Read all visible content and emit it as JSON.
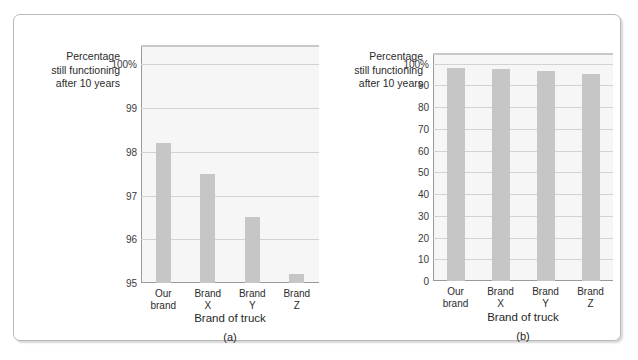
{
  "figure": {
    "panels": [
      {
        "id": "a",
        "caption": "(a)",
        "y_caption_lines": [
          "Percentage",
          "still functioning",
          "after 10 years"
        ],
        "x_axis_title": "Brand of truck",
        "chart_data": {
          "type": "bar",
          "title": "",
          "xlabel": "Brand of truck",
          "ylabel": "Percentage still functioning after 10 years",
          "categories": [
            "Our brand",
            "Brand X",
            "Brand Y",
            "Brand Z"
          ],
          "category_lines": [
            [
              "Our",
              "brand"
            ],
            [
              "Brand",
              "X"
            ],
            [
              "Brand",
              "Y"
            ],
            [
              "Brand",
              "Z"
            ]
          ],
          "values": [
            98.2,
            97.5,
            96.5,
            95.2
          ],
          "ylim": [
            95,
            100.4
          ],
          "yticks": [
            95,
            96,
            97,
            98,
            99,
            100
          ],
          "ytick_labels": [
            "95",
            "96",
            "97",
            "98",
            "99",
            "100%"
          ],
          "grid": true,
          "legend": "none",
          "bar_color": "#c6c6c6",
          "plot_background": "#f6f6f6"
        }
      },
      {
        "id": "b",
        "caption": "(b)",
        "y_caption_lines": [
          "Percentage",
          "still functioning",
          "after 10 years"
        ],
        "x_axis_title": "Brand of truck",
        "chart_data": {
          "type": "bar",
          "title": "",
          "xlabel": "Brand of truck",
          "ylabel": "Percentage still functioning after 10 years",
          "categories": [
            "Our brand",
            "Brand X",
            "Brand Y",
            "Brand Z"
          ],
          "category_lines": [
            [
              "Our",
              "brand"
            ],
            [
              "Brand",
              "X"
            ],
            [
              "Brand",
              "Y"
            ],
            [
              "Brand",
              "Z"
            ]
          ],
          "values": [
            98.2,
            97.5,
            96.5,
            95.2
          ],
          "ylim": [
            0,
            104
          ],
          "yticks": [
            0,
            10,
            20,
            30,
            40,
            50,
            60,
            70,
            80,
            90,
            100
          ],
          "ytick_labels": [
            "0",
            "10",
            "20",
            "30",
            "40",
            "50",
            "60",
            "70",
            "80",
            "90",
            "100%"
          ],
          "grid": true,
          "legend": "none",
          "bar_color": "#c6c6c6",
          "plot_background": "#f6f6f6"
        }
      }
    ]
  }
}
